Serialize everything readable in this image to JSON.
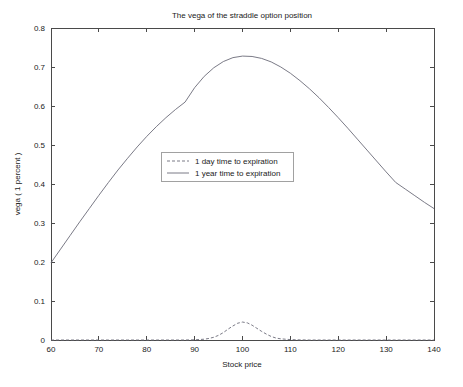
{
  "chart_data": {
    "type": "line",
    "title": "The vega of the straddle option position",
    "xlabel": "Stock price",
    "ylabel": "vega ( 1 percent )",
    "xlim": [
      60,
      140
    ],
    "ylim": [
      0,
      0.8
    ],
    "xticks": [
      60,
      70,
      80,
      90,
      100,
      110,
      120,
      130,
      140
    ],
    "xticklabels": [
      "60",
      "70",
      "80",
      "90",
      "100",
      "110",
      "120",
      "130",
      "140"
    ],
    "yticks": [
      0,
      0.1,
      0.2,
      0.3,
      0.4,
      0.5,
      0.6,
      0.7,
      0.8
    ],
    "yticklabels": [
      "0",
      "0.1",
      "0.2",
      "0.3",
      "0.4",
      "0.5",
      "0.6",
      "0.7",
      "0.8"
    ],
    "grid": false,
    "legend_position": "center-left",
    "series": [
      {
        "name": "1 day time to expiration",
        "style": "dashed",
        "color": "#6b6b78",
        "x": [
          60,
          62,
          64,
          66,
          68,
          70,
          72,
          74,
          76,
          78,
          80,
          82,
          84,
          86,
          88,
          90,
          92,
          93,
          94,
          95,
          96,
          97,
          98,
          99,
          100,
          101,
          102,
          103,
          104,
          105,
          106,
          107,
          108,
          110,
          112,
          114,
          116,
          118,
          120,
          125,
          130,
          135,
          140
        ],
        "y": [
          0,
          0,
          0,
          0,
          0,
          0,
          0,
          0,
          0,
          0,
          0,
          0,
          0,
          0,
          0,
          0.0005,
          0.002,
          0.004,
          0.007,
          0.012,
          0.019,
          0.028,
          0.036,
          0.043,
          0.046,
          0.044,
          0.038,
          0.03,
          0.022,
          0.015,
          0.009,
          0.005,
          0.003,
          0.001,
          0.0003,
          0,
          0,
          0,
          0,
          0,
          0,
          0,
          0
        ]
      },
      {
        "name": "1 year time to expiration",
        "style": "solid",
        "color": "#6b6b78",
        "x": [
          60,
          62,
          64,
          66,
          68,
          70,
          72,
          74,
          76,
          78,
          80,
          82,
          84,
          86,
          88,
          90,
          92,
          94,
          96,
          98,
          100,
          102,
          104,
          106,
          108,
          110,
          112,
          114,
          116,
          118,
          120,
          122,
          124,
          126,
          128,
          130,
          132,
          134,
          136,
          138,
          140
        ],
        "y": [
          0.198,
          0.233,
          0.268,
          0.303,
          0.337,
          0.371,
          0.404,
          0.436,
          0.466,
          0.495,
          0.522,
          0.547,
          0.57,
          0.591,
          0.61,
          0.647,
          0.676,
          0.698,
          0.714,
          0.724,
          0.728,
          0.727,
          0.722,
          0.713,
          0.7,
          0.684,
          0.665,
          0.644,
          0.621,
          0.596,
          0.57,
          0.543,
          0.515,
          0.487,
          0.459,
          0.431,
          0.404,
          0.387,
          0.37,
          0.353,
          0.337
        ]
      }
    ]
  },
  "plot_geometry": {
    "left": 51,
    "right": 434,
    "top": 28,
    "bottom": 340
  },
  "legend": {
    "box": {
      "x": 161,
      "y": 152,
      "width": 132,
      "height": 29
    },
    "entries": [
      {
        "label": "1 day time to expiration",
        "style": "dashed"
      },
      {
        "label": "1 year time to expiration",
        "style": "solid"
      }
    ]
  }
}
